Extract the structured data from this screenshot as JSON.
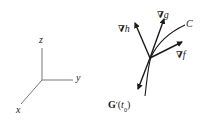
{
  "axes": {
    "z_label": "z",
    "y_label": "y",
    "x_label": "x"
  },
  "vectors": {
    "grad_h": {
      "symbol": "∇",
      "var": "h"
    },
    "grad_g": {
      "symbol": "∇",
      "var": "g"
    },
    "grad_f": {
      "symbol": "∇",
      "var": "f"
    },
    "curve_label": "C",
    "tangent": {
      "name": "G",
      "prime": "′",
      "open": "(",
      "t": "t",
      "sub": "0",
      "close": ")"
    }
  },
  "colors": {
    "ink": "#1a1a1a",
    "axis": "#777777",
    "background": "#ffffff"
  }
}
